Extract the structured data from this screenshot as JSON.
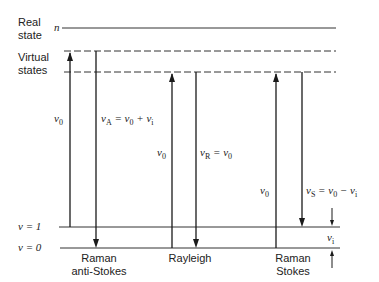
{
  "levels": {
    "real_state_label": [
      "Real",
      "state"
    ],
    "real_state_symbol": "n",
    "virtual_states_label": [
      "Virtual",
      "states"
    ],
    "v1_label": "v = 1",
    "v0_label": "v = 0"
  },
  "transitions": [
    {
      "name": "Raman anti-Stokes",
      "label_lines": [
        "Raman",
        "anti-Stokes"
      ],
      "up": "ν0",
      "down": "νA = ν0 + νi"
    },
    {
      "name": "Rayleigh",
      "label_lines": [
        "Rayleigh"
      ],
      "up": "ν0",
      "down": "νR = ν0"
    },
    {
      "name": "Raman Stokes",
      "label_lines": [
        "Raman",
        "Stokes"
      ],
      "up": "ν0",
      "down": "νS = ν0 − νi"
    }
  ],
  "vi_label": "νi",
  "labels": {
    "nu": "ν",
    "sub_0": "0",
    "sub_A": "A",
    "sub_R": "R",
    "sub_S": "S",
    "sub_i": "i",
    "eq": " = ",
    "plus": " + ",
    "minus": " − "
  }
}
